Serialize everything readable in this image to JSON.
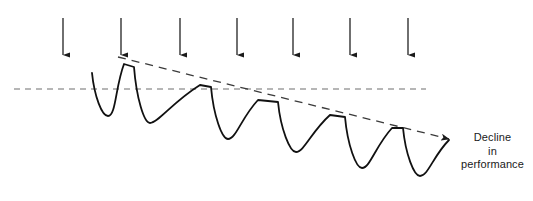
{
  "figure": {
    "background_color": "#ffffff",
    "width": 533,
    "height": 201
  },
  "caption": {
    "name": "decline-in-performance-label",
    "lines": [
      "Decline",
      "in",
      "performance"
    ],
    "full_text": "Decline in performance",
    "color": "#1a1a1a",
    "font_size_px": 11
  },
  "baseline": {
    "name": "baseline-dashed-line",
    "style": "dashed",
    "color": "#6e6e6e",
    "y": 89,
    "x_start": 14,
    "x_end": 426,
    "dash_pattern": "6 5",
    "stroke_width": 1.2
  },
  "trend_line": {
    "name": "declining-trend-dashed-line",
    "style": "dashed",
    "color": "#3a3a3a",
    "label": "Decline in performance",
    "x_start": 118,
    "y_start": 57,
    "x_end": 449,
    "y_end": 139,
    "dash_pattern": "8 6",
    "stroke_width": 1.3,
    "arrowhead": true
  },
  "load_arrows": {
    "name": "applied-load-arrows",
    "count": 7,
    "color": "#222222",
    "y_start": 18,
    "y_end": 55,
    "stroke_width": 1.3,
    "x_positions": [
      63,
      121,
      180,
      237,
      293,
      350,
      408
    ]
  },
  "chart_data": {
    "type": "line",
    "title": "Decline in performance",
    "xlabel": "",
    "ylabel": "",
    "grid": false,
    "legend": null,
    "annotations": [
      {
        "text": "Decline in performance",
        "x": 449,
        "y": 139,
        "arrow_to": [
          449,
          139
        ]
      }
    ],
    "axis_notes": {
      "baseline_y_px": 89,
      "trend_start_px": [
        118,
        57
      ],
      "trend_end_px": [
        449,
        139
      ]
    },
    "series": [
      {
        "name": "performance",
        "description": "Repeated sawtooth recovery cycles with progressively lower peaks and troughs",
        "cycles": [
          {
            "index": 1,
            "peak_x": 92,
            "peak_y": 73,
            "trough_x": 108,
            "trough_y": 116,
            "recover_x": 124,
            "recover_y": 64
          },
          {
            "index": 2,
            "peak_x": 134,
            "peak_y": 67,
            "trough_x": 150,
            "trough_y": 123,
            "recover_x": 200,
            "recover_y": 85
          },
          {
            "index": 3,
            "peak_x": 211,
            "peak_y": 87,
            "trough_x": 228,
            "trough_y": 139,
            "recover_x": 258,
            "recover_y": 100
          },
          {
            "index": 4,
            "peak_x": 278,
            "peak_y": 102,
            "trough_x": 296,
            "trough_y": 152,
            "recover_x": 330,
            "recover_y": 115
          },
          {
            "index": 5,
            "peak_x": 345,
            "peak_y": 117,
            "trough_x": 362,
            "trough_y": 168,
            "recover_x": 392,
            "recover_y": 128
          },
          {
            "index": 6,
            "peak_x": 403,
            "peak_y": 128,
            "trough_x": 420,
            "trough_y": 176,
            "recover_x": 449,
            "recover_y": 140
          }
        ],
        "stroke_color": "#111111",
        "stroke_width": 1.8
      }
    ]
  }
}
